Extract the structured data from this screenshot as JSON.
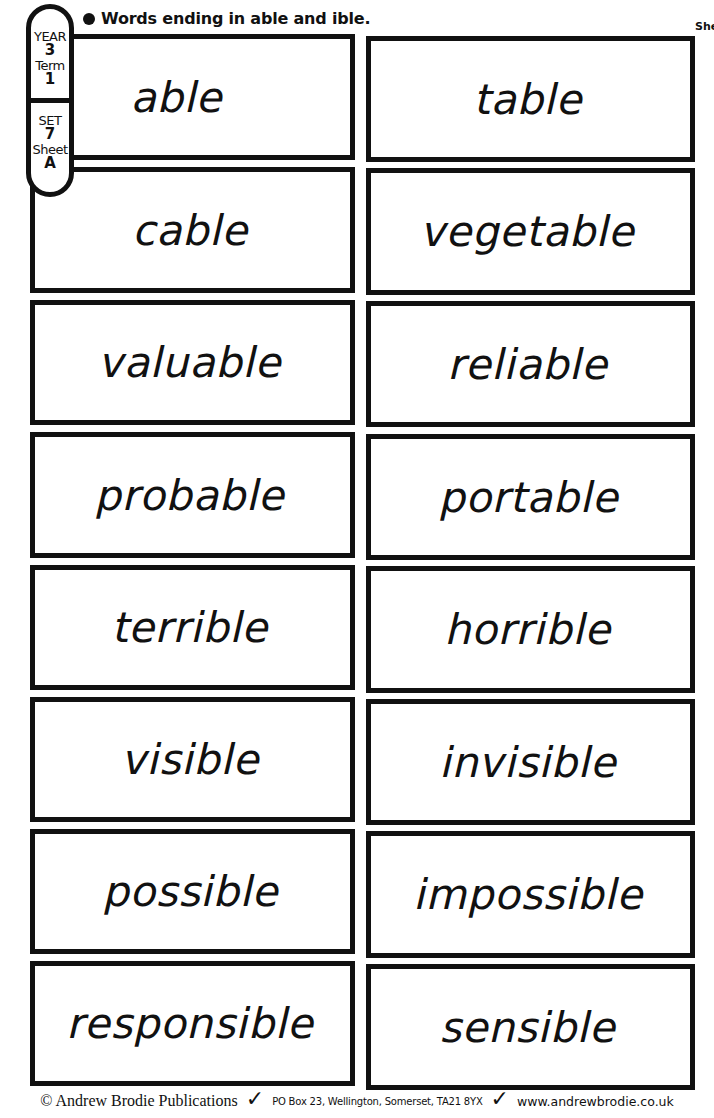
{
  "header": {
    "title": "Words ending in able and ible.",
    "corner_text": "She"
  },
  "badge": {
    "year_label": "YEAR",
    "year_value": "3",
    "term_label": "Term",
    "term_value": "1",
    "set_label": "SET",
    "set_value": "7",
    "sheet_label": "Sheet",
    "sheet_value": "A"
  },
  "cards": {
    "left": [
      "able",
      "cable",
      "valuable",
      "probable",
      "terrible",
      "visible",
      "possible",
      "responsible"
    ],
    "right": [
      "table",
      "vegetable",
      "reliable",
      "portable",
      "horrible",
      "invisible",
      "impossible",
      "sensible"
    ]
  },
  "footer": {
    "copyright": "© Andrew Brodie Publications",
    "tick_icon": "✓",
    "address": "PO Box 23, Wellington, Somerset, TA21 8YX",
    "website": "www.andrewbrodie.co.uk"
  }
}
